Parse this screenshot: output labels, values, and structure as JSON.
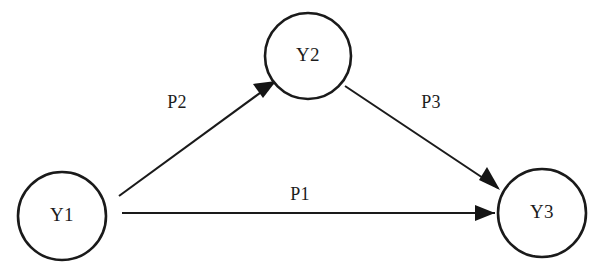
{
  "diagram": {
    "type": "path-diagram",
    "title": "",
    "background_color": "#ffffff",
    "line_color": "#1a1a1a",
    "text_color": "#1c1c1c",
    "nodes": [
      {
        "id": "Y1",
        "label": "Y1",
        "cx": 62,
        "cy": 216,
        "r": 44
      },
      {
        "id": "Y2",
        "label": "Y2",
        "cx": 308,
        "cy": 56,
        "r": 43
      },
      {
        "id": "Y3",
        "label": "Y3",
        "cx": 542,
        "cy": 213,
        "r": 44
      }
    ],
    "paths": [
      {
        "id": "P1",
        "label": "P1",
        "from": "Y1",
        "to": "Y3",
        "label_x": 300,
        "label_y": 196,
        "x1": 122,
        "y1": 213,
        "x2": 495,
        "y2": 213
      },
      {
        "id": "P2",
        "label": "P2",
        "from": "Y1",
        "to": "Y2",
        "label_x": 177,
        "label_y": 104,
        "x1": 119,
        "y1": 196,
        "x2": 273,
        "y2": 83
      },
      {
        "id": "P3",
        "label": "P3",
        "from": "Y2",
        "to": "Y3",
        "label_x": 431,
        "label_y": 104,
        "x1": 345,
        "y1": 86,
        "x2": 499,
        "y2": 189
      }
    ]
  }
}
